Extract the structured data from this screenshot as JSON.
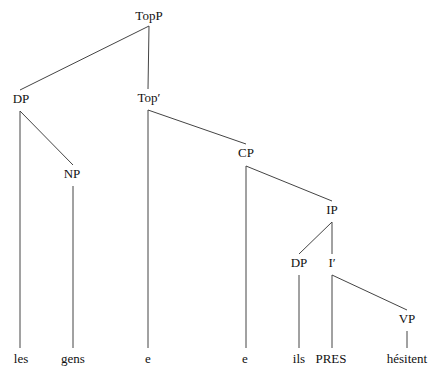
{
  "tree": {
    "nodes": [
      {
        "id": "topp",
        "label": "TopP",
        "x": 149,
        "y": 9
      },
      {
        "id": "dp1",
        "label": "DP",
        "x": 21,
        "y": 92
      },
      {
        "id": "topbar",
        "label": "Top′",
        "x": 149,
        "y": 91
      },
      {
        "id": "np",
        "label": "NP",
        "x": 72,
        "y": 167
      },
      {
        "id": "cp",
        "label": "CP",
        "x": 246,
        "y": 146
      },
      {
        "id": "ip",
        "label": "IP",
        "x": 332,
        "y": 203
      },
      {
        "id": "dp2",
        "label": "DP",
        "x": 299,
        "y": 256
      },
      {
        "id": "ibar",
        "label": "I′",
        "x": 332,
        "y": 256
      },
      {
        "id": "vp",
        "label": "VP",
        "x": 407,
        "y": 312
      },
      {
        "id": "les",
        "label": "les",
        "x": 21,
        "y": 352
      },
      {
        "id": "gens",
        "label": "gens",
        "x": 73,
        "y": 352
      },
      {
        "id": "e1",
        "label": "e",
        "x": 148,
        "y": 352
      },
      {
        "id": "e2",
        "label": "e",
        "x": 245,
        "y": 352
      },
      {
        "id": "ils",
        "label": "ils",
        "x": 299,
        "y": 352
      },
      {
        "id": "pres",
        "label": "PRES",
        "x": 331,
        "y": 352
      },
      {
        "id": "hesitent",
        "label": "hésitent",
        "x": 407,
        "y": 352
      }
    ],
    "edges": [
      [
        149,
        26,
        20,
        90
      ],
      [
        149,
        26,
        148,
        89
      ],
      [
        20,
        111,
        20,
        348
      ],
      [
        20,
        111,
        73,
        165
      ],
      [
        73,
        186,
        73,
        348
      ],
      [
        148,
        110,
        148,
        348
      ],
      [
        148,
        110,
        246,
        144
      ],
      [
        246,
        166,
        246,
        348
      ],
      [
        246,
        166,
        332,
        201
      ],
      [
        332,
        222,
        299,
        254
      ],
      [
        332,
        222,
        332,
        254
      ],
      [
        299,
        275,
        299,
        348
      ],
      [
        332,
        275,
        332,
        348
      ],
      [
        332,
        275,
        407,
        310
      ],
      [
        407,
        331,
        407,
        348
      ]
    ],
    "line_color": "#444444"
  }
}
